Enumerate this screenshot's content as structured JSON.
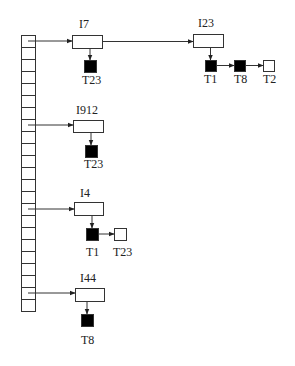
{
  "diagram": {
    "type": "inverted-index-hash-table",
    "hash_table": {
      "x": 21,
      "y": 35,
      "width": 14,
      "cell_height": 12,
      "cell_count": 23
    },
    "colors": {
      "stroke": "#333333",
      "filled_node": "#000000",
      "empty_node": "#ffffff",
      "background": "#ffffff"
    },
    "entries": [
      {
        "label": "I7",
        "slot": 0,
        "box": {
          "x": 72,
          "y": 35,
          "w": 30,
          "h": 13
        },
        "label_pos": {
          "x": 79,
          "y": 28
        },
        "postings": [
          {
            "label": "T23",
            "filled": true,
            "x": 84,
            "y": 60,
            "size": 12,
            "label_x": 82,
            "label_y": 84
          }
        ]
      },
      {
        "label": "I23",
        "slot": null,
        "chained_from": "I7",
        "box": {
          "x": 193,
          "y": 34,
          "w": 30,
          "h": 13
        },
        "label_pos": {
          "x": 198,
          "y": 27
        },
        "postings": [
          {
            "label": "T1",
            "filled": true,
            "x": 205,
            "y": 60,
            "size": 11,
            "label_x": 204,
            "label_y": 83
          },
          {
            "label": "T8",
            "filled": true,
            "x": 234,
            "y": 60,
            "size": 11,
            "label_x": 234,
            "label_y": 83
          },
          {
            "label": "T2",
            "filled": false,
            "x": 263,
            "y": 60,
            "size": 11,
            "label_x": 263,
            "label_y": 83
          }
        ]
      },
      {
        "label": "I912",
        "slot": 7,
        "box": {
          "x": 73,
          "y": 120,
          "w": 30,
          "h": 12
        },
        "label_pos": {
          "x": 76,
          "y": 114
        },
        "postings": [
          {
            "label": "T23",
            "filled": true,
            "x": 85,
            "y": 145,
            "size": 12,
            "label_x": 84,
            "label_y": 168
          }
        ]
      },
      {
        "label": "I4",
        "slot": 14,
        "box": {
          "x": 74,
          "y": 202,
          "w": 29,
          "h": 13
        },
        "label_pos": {
          "x": 80,
          "y": 197
        },
        "postings": [
          {
            "label": "T1",
            "filled": true,
            "x": 86,
            "y": 228,
            "size": 12,
            "label_x": 86,
            "label_y": 256
          },
          {
            "label": "T23",
            "filled": false,
            "x": 114,
            "y": 228,
            "size": 12,
            "label_x": 113,
            "label_y": 256
          }
        ]
      },
      {
        "label": "I44",
        "slot": 21,
        "box": {
          "x": 75,
          "y": 288,
          "w": 29,
          "h": 13
        },
        "label_pos": {
          "x": 80,
          "y": 282
        },
        "postings": [
          {
            "label": "T8",
            "filled": true,
            "x": 81,
            "y": 314,
            "size": 12,
            "label_x": 81,
            "label_y": 344
          }
        ]
      }
    ]
  }
}
